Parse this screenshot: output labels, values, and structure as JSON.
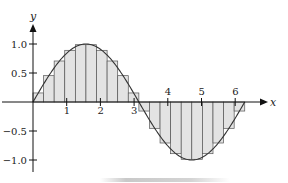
{
  "chart_data": {
    "type": "line",
    "title": "",
    "xlabel": "x",
    "ylabel": "y",
    "function": "sin(x)",
    "xlim": [
      0,
      6.6
    ],
    "ylim": [
      -1.15,
      1.35
    ],
    "x_ticks": [
      1,
      2,
      3,
      4,
      5,
      6
    ],
    "x_tick_labels": [
      "1",
      "2",
      "3",
      "4",
      "5",
      "6"
    ],
    "y_ticks": [
      1.0,
      0.5,
      -0.5,
      -1.0
    ],
    "y_tick_labels": [
      "1.0",
      "0.5",
      "−0.5",
      "−1.0"
    ],
    "grid": false,
    "legend": null,
    "series": [
      {
        "name": "y = sin x",
        "kind": "curve",
        "domain": [
          0,
          6.2832
        ]
      },
      {
        "name": "midpoint rectangles",
        "kind": "bar",
        "n": 20,
        "width": 0.31416,
        "x_left": [
          0,
          0.314,
          0.628,
          0.942,
          1.257,
          1.571,
          1.885,
          2.199,
          2.513,
          2.827,
          3.142,
          3.456,
          3.77,
          4.084,
          4.398,
          4.712,
          5.027,
          5.341,
          5.655,
          5.969
        ],
        "values": [
          0.156,
          0.454,
          0.707,
          0.891,
          0.988,
          0.988,
          0.891,
          0.707,
          0.454,
          0.156,
          -0.156,
          -0.454,
          -0.707,
          -0.891,
          -0.988,
          -0.988,
          -0.891,
          -0.707,
          -0.454,
          -0.156
        ]
      }
    ],
    "colors": {
      "fill": "#e3e3e3",
      "stroke": "#333333",
      "axis": "#111111"
    }
  }
}
